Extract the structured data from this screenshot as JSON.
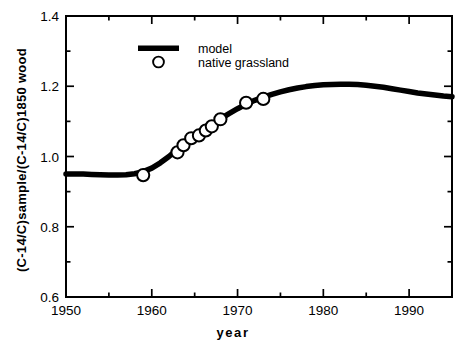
{
  "chart_data": {
    "type": "line",
    "title": "",
    "xlabel": "year",
    "ylabel": "(C-14/C)sample/(C-14/C)1850  wood",
    "xlim": [
      1950,
      1995
    ],
    "ylim": [
      0.6,
      1.4
    ],
    "x_major_ticks": [
      1950,
      1960,
      1970,
      1980,
      1990
    ],
    "x_major_tick_labels": [
      "1950",
      "1960",
      "1970",
      "1980",
      "1990"
    ],
    "x_minor_ticks": [
      1955,
      1965,
      1975,
      1985,
      1995
    ],
    "y_major_ticks": [
      0.6,
      0.8,
      1.0,
      1.2,
      1.4
    ],
    "y_major_tick_labels": [
      "0.6",
      "0.8",
      "1.0",
      "1.2",
      "1.4"
    ],
    "y_minor_ticks": [
      0.7,
      0.9,
      1.1,
      1.3
    ],
    "grid": false,
    "legend_position": "top-center",
    "series": [
      {
        "name": "model",
        "type": "line",
        "style": "thick-solid-black",
        "color": "#000000",
        "points": [
          [
            1950.0,
            0.95
          ],
          [
            1951.0,
            0.95
          ],
          [
            1952.0,
            0.95
          ],
          [
            1953.0,
            0.949
          ],
          [
            1954.0,
            0.948
          ],
          [
            1955.0,
            0.947
          ],
          [
            1956.0,
            0.947
          ],
          [
            1957.0,
            0.948
          ],
          [
            1958.0,
            0.951
          ],
          [
            1959.0,
            0.957
          ],
          [
            1960.0,
            0.967
          ],
          [
            1961.0,
            0.982
          ],
          [
            1962.0,
            1.0
          ],
          [
            1963.0,
            1.021
          ],
          [
            1964.0,
            1.041
          ],
          [
            1965.0,
            1.059
          ],
          [
            1966.0,
            1.076
          ],
          [
            1967.0,
            1.092
          ],
          [
            1968.0,
            1.107
          ],
          [
            1969.0,
            1.122
          ],
          [
            1970.0,
            1.136
          ],
          [
            1971.0,
            1.149
          ],
          [
            1972.0,
            1.16
          ],
          [
            1973.0,
            1.169
          ],
          [
            1974.0,
            1.177
          ],
          [
            1975.0,
            1.184
          ],
          [
            1976.0,
            1.19
          ],
          [
            1977.0,
            1.195
          ],
          [
            1978.0,
            1.199
          ],
          [
            1979.0,
            1.202
          ],
          [
            1980.0,
            1.204
          ],
          [
            1981.0,
            1.205
          ],
          [
            1982.0,
            1.206
          ],
          [
            1983.0,
            1.206
          ],
          [
            1984.0,
            1.205
          ],
          [
            1985.0,
            1.203
          ],
          [
            1986.0,
            1.2
          ],
          [
            1987.0,
            1.197
          ],
          [
            1988.0,
            1.193
          ],
          [
            1989.0,
            1.189
          ],
          [
            1990.0,
            1.185
          ],
          [
            1991.0,
            1.181
          ],
          [
            1992.0,
            1.178
          ],
          [
            1993.0,
            1.175
          ],
          [
            1994.0,
            1.172
          ],
          [
            1995.0,
            1.17
          ]
        ]
      },
      {
        "name": "native grassland",
        "type": "scatter",
        "style": "open-circle",
        "color": "#000000",
        "points": [
          [
            1959.0,
            0.947
          ],
          [
            1963.0,
            1.012
          ],
          [
            1963.7,
            1.032
          ],
          [
            1964.6,
            1.052
          ],
          [
            1965.5,
            1.06
          ],
          [
            1966.3,
            1.074
          ],
          [
            1967.0,
            1.086
          ],
          [
            1968.0,
            1.106
          ],
          [
            1971.0,
            1.153
          ],
          [
            1973.0,
            1.164
          ]
        ]
      }
    ]
  },
  "legend": {
    "entries": [
      {
        "label": "model",
        "marker": "line"
      },
      {
        "label": "native grassland",
        "marker": "circle"
      }
    ]
  },
  "axes": {
    "x_title": "year",
    "y_title": "(C-14/C)sample/(C-14/C)1850  wood"
  }
}
